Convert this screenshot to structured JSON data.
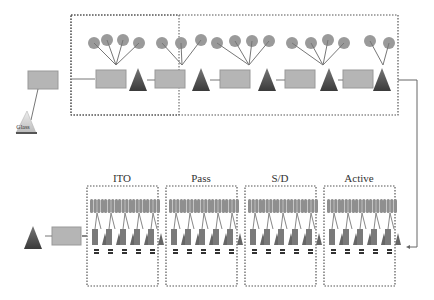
{
  "diagram": {
    "top_row": {
      "input_material": "Glass",
      "stages": 5
    },
    "bottom_row": {
      "stages": [
        {
          "label": "ITO"
        },
        {
          "label": "Pass"
        },
        {
          "label": "S/D"
        },
        {
          "label": "Active"
        }
      ]
    },
    "colors": {
      "box": "#b5b5b5",
      "circle": "#9a9a9a",
      "triangle": "#555555",
      "border": "#555555",
      "line": "#777777"
    }
  }
}
